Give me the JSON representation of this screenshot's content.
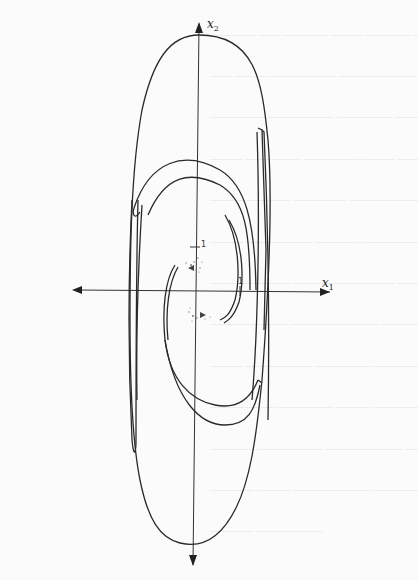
{
  "figure": {
    "type": "phase-portrait",
    "x_axis": {
      "label": "x",
      "subscript": "1",
      "tick_label": "1"
    },
    "y_axis": {
      "label": "x",
      "subscript": "2",
      "tick_label": "1"
    }
  },
  "background": {
    "show_through_text": "reverse-side page text (illegible)"
  }
}
